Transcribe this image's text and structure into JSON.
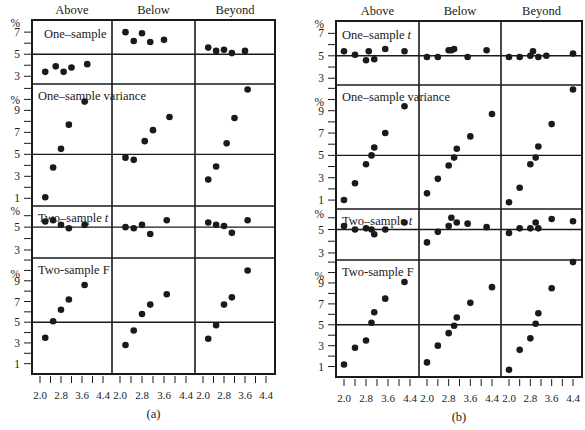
{
  "chart_data": [
    {
      "type": "scatter",
      "panel_label": "(a)",
      "columns": [
        "Above",
        "Below",
        "Beyond"
      ],
      "xticks": [
        "2.0",
        "2.8",
        "3.6",
        "4.4"
      ],
      "xlim": [
        2.0,
        4.4
      ],
      "rows": [
        {
          "label": "One–sample",
          "italic_suffix": "",
          "yticks": [
            "%",
            "7",
            "5",
            "3"
          ],
          "ref": 5,
          "series": [
            {
              "column": "Above",
              "x": [
                2.2,
                2.6,
                2.9,
                3.2,
                3.8
              ],
              "y": [
                3.4,
                3.9,
                3.4,
                3.8,
                4.1
              ]
            },
            {
              "column": "Below",
              "x": [
                2.2,
                2.5,
                2.8,
                3.1,
                3.6
              ],
              "y": [
                7.0,
                6.2,
                6.9,
                6.1,
                6.3
              ]
            },
            {
              "column": "Beyond",
              "x": [
                2.2,
                2.5,
                2.8,
                3.1,
                3.6
              ],
              "y": [
                5.6,
                5.3,
                5.4,
                5.1,
                5.3
              ]
            }
          ]
        },
        {
          "label": "One–sample variance",
          "italic_suffix": "",
          "yticks": [
            "%",
            "9",
            "7",
            "5",
            "3",
            "1"
          ],
          "ref": 5,
          "series": [
            {
              "column": "Above",
              "x": [
                2.2,
                2.5,
                2.8,
                3.1,
                3.7
              ],
              "y": [
                1.1,
                3.8,
                5.5,
                7.7,
                9.8
              ]
            },
            {
              "column": "Below",
              "x": [
                2.2,
                2.5,
                2.9,
                3.2,
                3.8
              ],
              "y": [
                4.7,
                4.5,
                6.2,
                7.2,
                8.4
              ]
            },
            {
              "column": "Beyond",
              "x": [
                2.2,
                2.5,
                2.9,
                3.2,
                3.7
              ],
              "y": [
                2.7,
                3.9,
                6.0,
                8.3,
                10.9
              ]
            }
          ]
        },
        {
          "label": "Two–sample",
          "italic_suffix": "t",
          "yticks": [
            "%",
            "5",
            "3"
          ],
          "ref": 5,
          "series": [
            {
              "column": "Above",
              "x": [
                2.2,
                2.5,
                2.8,
                3.1,
                3.7
              ],
              "y": [
                5.5,
                5.6,
                5.2,
                4.9,
                5.2
              ]
            },
            {
              "column": "Below",
              "x": [
                2.2,
                2.5,
                2.8,
                3.1,
                3.7
              ],
              "y": [
                5.0,
                4.9,
                5.2,
                4.4,
                5.6
              ]
            },
            {
              "column": "Beyond",
              "x": [
                2.2,
                2.5,
                2.8,
                3.1,
                3.7
              ],
              "y": [
                5.4,
                5.2,
                5.1,
                4.5,
                5.6
              ]
            }
          ]
        },
        {
          "label": "Two-sample F",
          "italic_suffix": "",
          "yticks": [
            "%",
            "9",
            "7",
            "5",
            "3",
            "1"
          ],
          "ref": 5,
          "series": [
            {
              "column": "Above",
              "x": [
                2.2,
                2.5,
                2.8,
                3.1,
                3.7
              ],
              "y": [
                3.5,
                5.1,
                6.2,
                7.2,
                8.6
              ]
            },
            {
              "column": "Below",
              "x": [
                2.2,
                2.5,
                2.8,
                3.1,
                3.7
              ],
              "y": [
                2.8,
                4.2,
                5.8,
                6.7,
                7.7
              ]
            },
            {
              "column": "Beyond",
              "x": [
                2.2,
                2.5,
                2.8,
                3.1,
                3.7
              ],
              "y": [
                3.4,
                4.7,
                6.7,
                7.4,
                10.0
              ]
            }
          ]
        }
      ]
    },
    {
      "type": "scatter",
      "panel_label": "(b)",
      "columns": [
        "Above",
        "Below",
        "Beyond"
      ],
      "xticks": [
        "2.0",
        "2.8",
        "3.6",
        "4.4"
      ],
      "xlim": [
        2.0,
        4.4
      ],
      "rows": [
        {
          "label": "One–sample",
          "italic_suffix": "t",
          "yticks": [
            "%",
            "7",
            "5",
            "3"
          ],
          "ref": 5,
          "series": [
            {
              "column": "Above",
              "x": [
                2.0,
                2.4,
                2.8,
                2.9,
                3.1,
                3.5,
                4.2
              ],
              "y": [
                5.4,
                5.1,
                4.6,
                5.4,
                4.7,
                5.6,
                5.4
              ]
            },
            {
              "column": "Below",
              "x": [
                2.0,
                2.4,
                2.8,
                2.9,
                3.0,
                3.5,
                4.2
              ],
              "y": [
                4.9,
                4.9,
                5.5,
                5.5,
                5.6,
                4.9,
                5.5
              ]
            },
            {
              "column": "Beyond",
              "x": [
                2.0,
                2.4,
                2.8,
                2.9,
                3.1,
                3.4,
                4.4
              ],
              "y": [
                4.9,
                4.9,
                5.0,
                5.4,
                4.9,
                5.0,
                5.2
              ]
            }
          ]
        },
        {
          "label": "One–sample variance",
          "italic_suffix": "",
          "yticks": [
            "%",
            "9",
            "7",
            "5",
            "3",
            "1"
          ],
          "ref": 5,
          "series": [
            {
              "column": "Above",
              "x": [
                2.0,
                2.4,
                2.8,
                3.0,
                3.1,
                3.5,
                4.2
              ],
              "y": [
                1.0,
                2.5,
                4.2,
                5.0,
                5.7,
                7.0,
                9.4
              ]
            },
            {
              "column": "Below",
              "x": [
                2.0,
                2.4,
                2.8,
                3.0,
                3.1,
                3.6,
                4.4
              ],
              "y": [
                1.6,
                2.9,
                4.1,
                4.8,
                5.6,
                6.7,
                8.7
              ]
            },
            {
              "column": "Beyond",
              "x": [
                2.0,
                2.4,
                2.8,
                3.0,
                3.1,
                3.6,
                4.4
              ],
              "y": [
                0.8,
                2.1,
                4.2,
                4.8,
                5.8,
                7.8,
                10.9
              ]
            }
          ]
        },
        {
          "label": "Two–sample",
          "italic_suffix": "t",
          "yticks": [
            "%",
            "5",
            "3"
          ],
          "ref": 5,
          "series": [
            {
              "column": "Above",
              "x": [
                2.0,
                2.4,
                2.8,
                3.0,
                3.1,
                3.5,
                4.2
              ],
              "y": [
                5.3,
                5.0,
                5.1,
                5.0,
                4.6,
                5.0,
                5.6
              ]
            },
            {
              "column": "Below",
              "x": [
                2.0,
                2.4,
                2.8,
                2.9,
                3.1,
                3.5,
                4.2
              ],
              "y": [
                3.9,
                4.8,
                5.3,
                6.0,
                5.6,
                5.5,
                5.2
              ]
            },
            {
              "column": "Beyond",
              "x": [
                2.0,
                2.4,
                2.8,
                3.0,
                3.1,
                3.6,
                4.4
              ],
              "y": [
                4.7,
                5.1,
                5.1,
                5.6,
                5.1,
                5.9,
                5.7
              ]
            }
          ]
        },
        {
          "label": "Two-sample F",
          "italic_suffix": "",
          "yticks": [
            "%",
            "9",
            "7",
            "5",
            "3",
            "1"
          ],
          "ref": 5,
          "series": [
            {
              "column": "Above",
              "x": [
                2.0,
                2.4,
                2.8,
                3.0,
                3.1,
                3.5,
                4.2
              ],
              "y": [
                1.2,
                2.8,
                3.5,
                5.2,
                6.2,
                7.5,
                9.1
              ]
            },
            {
              "column": "Below",
              "x": [
                2.0,
                2.4,
                2.8,
                3.0,
                3.1,
                3.6,
                4.4
              ],
              "y": [
                1.4,
                3.0,
                4.2,
                4.9,
                5.7,
                7.1,
                8.6
              ]
            },
            {
              "column": "Beyond",
              "x": [
                2.0,
                2.4,
                2.8,
                3.0,
                3.1,
                3.6,
                4.4
              ],
              "y": [
                0.7,
                2.6,
                3.7,
                5.1,
                6.1,
                8.5,
                11.0
              ]
            }
          ]
        }
      ]
    }
  ],
  "layout": {
    "panels": [
      {
        "left": 32,
        "cols": [
          32,
          112,
          195,
          275
        ],
        "rows": [
          20,
          84,
          206,
          258,
          374
        ],
        "yscale": [
          {
            "top_val": 8.1,
            "bot_val": 2.3
          },
          {
            "top_val": 11.4,
            "bot_val": 0.3
          },
          {
            "top_val": 6.85,
            "bot_val": 2.3
          },
          {
            "top_val": 11.2,
            "bot_val": 0.0
          }
        ]
      },
      {
        "left": 336,
        "cols": [
          336,
          419,
          501,
          582
        ],
        "rows": [
          21,
          85,
          209,
          260,
          377
        ],
        "yscale": [
          {
            "top_val": 8.1,
            "bot_val": 2.4
          },
          {
            "top_val": 11.3,
            "bot_val": 0.2
          },
          {
            "top_val": 6.75,
            "bot_val": 2.4
          },
          {
            "top_val": 11.2,
            "bot_val": 0.0
          }
        ]
      }
    ]
  }
}
